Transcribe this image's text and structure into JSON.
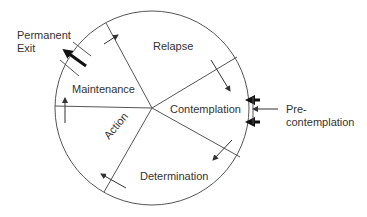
{
  "diagram": {
    "stages": [
      {
        "id": "relapse",
        "label": "Relapse"
      },
      {
        "id": "contemplation",
        "label": "Contemplation"
      },
      {
        "id": "determination",
        "label": "Determination"
      },
      {
        "id": "action",
        "label": "Action"
      },
      {
        "id": "maintenance",
        "label": "Maintenance"
      }
    ],
    "external": {
      "permanent_exit": {
        "line1": "Permanent",
        "line2": "Exit"
      },
      "pre_contemplation": {
        "line1": "Pre-",
        "line2": "contemplation"
      }
    },
    "colors": {
      "line": "#555555",
      "thick_arrow": "#111111",
      "text": "#333333"
    }
  }
}
